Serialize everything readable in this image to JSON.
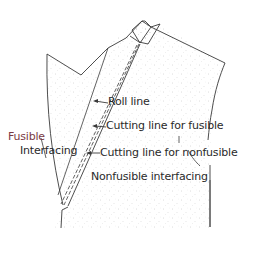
{
  "diagram": {
    "type": "garment-pattern-illustration",
    "colors": {
      "outline": "#3a3a3a",
      "fabric_speckle": "#b8b8b8",
      "text": "#2a2a2a",
      "accent_text": "#7a3a44"
    },
    "labels": {
      "fusible_interfacing": [
        "Fusible",
        "Interfacing"
      ],
      "roll_line": "Roll line",
      "cutting_line_fusible": "Cutting line for fusible",
      "cutting_line_nonfusible": "Cutting line for nonfusible",
      "nonfusible_interfacing": "Nonfusible interfacing"
    }
  }
}
